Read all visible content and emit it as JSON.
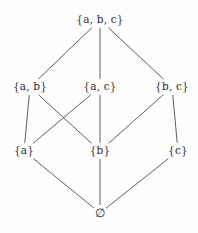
{
  "diagram": {
    "line_color": "#5e5e5e",
    "text_color": "#2b2b2b",
    "background_color": "#fefefe",
    "nodes": [
      {
        "id": "abc",
        "label": "{a, b, c}",
        "x": 100,
        "y": 20,
        "level": 3
      },
      {
        "id": "ab",
        "label": "{a, b}",
        "x": 30,
        "y": 87,
        "level": 2
      },
      {
        "id": "ac",
        "label": "{a, c}",
        "x": 100,
        "y": 87,
        "level": 2
      },
      {
        "id": "bc",
        "label": "{b, c}",
        "x": 172,
        "y": 87,
        "level": 2
      },
      {
        "id": "a",
        "label": "{a}",
        "x": 24,
        "y": 151,
        "level": 1
      },
      {
        "id": "b",
        "label": "{b}",
        "x": 100,
        "y": 151,
        "level": 1
      },
      {
        "id": "c",
        "label": "{c}",
        "x": 178,
        "y": 151,
        "level": 1
      },
      {
        "id": "empty",
        "label": "∅",
        "x": 100,
        "y": 213,
        "level": 0
      }
    ],
    "edges": [
      {
        "from": "abc",
        "to": "ab"
      },
      {
        "from": "abc",
        "to": "ac"
      },
      {
        "from": "abc",
        "to": "bc"
      },
      {
        "from": "ab",
        "to": "a"
      },
      {
        "from": "ab",
        "to": "b"
      },
      {
        "from": "ac",
        "to": "a"
      },
      {
        "from": "ac",
        "to": "b"
      },
      {
        "from": "bc",
        "to": "b"
      },
      {
        "from": "bc",
        "to": "c"
      },
      {
        "from": "a",
        "to": "empty"
      },
      {
        "from": "b",
        "to": "empty"
      },
      {
        "from": "c",
        "to": "empty"
      }
    ]
  }
}
